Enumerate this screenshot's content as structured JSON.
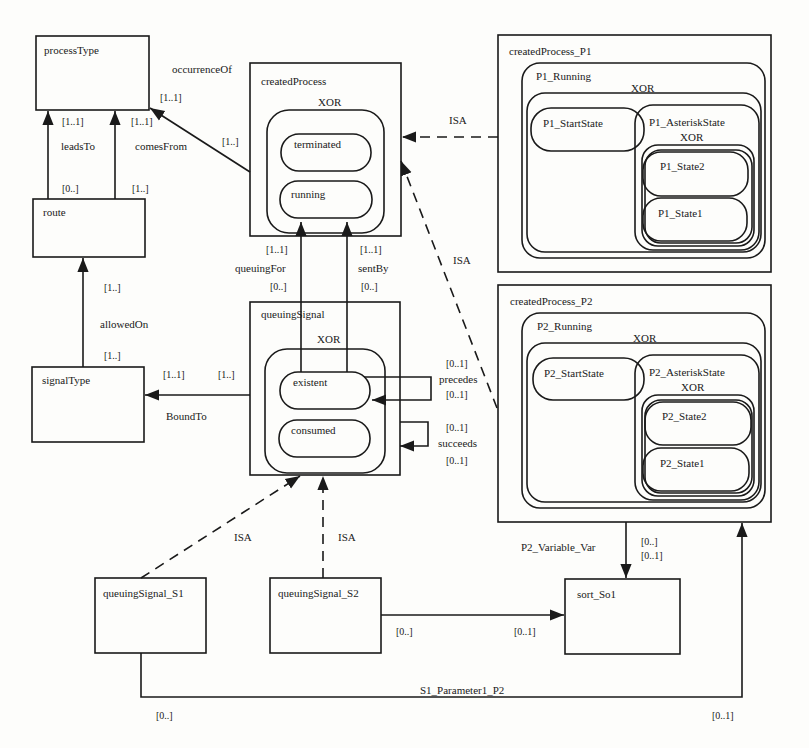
{
  "diagram": {
    "entities": {
      "processType": {
        "label": "processType"
      },
      "route": {
        "label": "route"
      },
      "signalType": {
        "label": "signalType"
      },
      "createdProcess": {
        "label": "createdProcess",
        "xor": "XOR",
        "states": [
          "terminated",
          "running"
        ]
      },
      "queuingSignal": {
        "label": "queuingSignal",
        "xor": "XOR",
        "states": [
          "existent",
          "consumed"
        ]
      },
      "createdProcess_P1": {
        "label": "createdProcess_P1",
        "running": "P1_Running",
        "xor": "XOR",
        "start": "P1_StartState",
        "asterisk": "P1_AsteriskState",
        "asterisk_xor": "XOR",
        "state2": "P1_State2",
        "state1": "P1_State1"
      },
      "createdProcess_P2": {
        "label": "createdProcess_P2",
        "running": "P2_Running",
        "xor": "XOR",
        "start": "P2_StartState",
        "asterisk": "P2_AsteriskState",
        "asterisk_xor": "XOR",
        "state2": "P2_State2",
        "state1": "P2_State1"
      },
      "queuingSignal_S1": {
        "label": "queuingSignal_S1"
      },
      "queuingSignal_S2": {
        "label": "queuingSignal_S2"
      },
      "sort_So1": {
        "label": "sort_So1"
      }
    },
    "relations": {
      "occurrenceOf": {
        "label": "occurrenceOf",
        "card_target": "[1..1]",
        "card_source": "[1..]"
      },
      "leadsTo": {
        "label": "leadsTo",
        "card_target": "[1..1]",
        "card_source": "[0..]"
      },
      "comesFrom": {
        "label": "comesFrom",
        "card_target": "[1..1]",
        "card_source": "[1..]"
      },
      "allowedOn": {
        "label": "allowedOn",
        "card_target": "[1..]",
        "card_source": "[1..]"
      },
      "boundTo": {
        "label": "BoundTo",
        "card_target": "[1..1]",
        "card_source": "[1..]"
      },
      "queuingFor": {
        "label": "queuingFor",
        "card_target": "[1..1]",
        "card_source": "[0..]"
      },
      "sentBy": {
        "label": "sentBy",
        "card_target": "[1..1]",
        "card_source": "[0..]"
      },
      "precedes": {
        "label": "precedes",
        "card_top": "[0..1]",
        "card_bottom": "[0..1]"
      },
      "succeeds": {
        "label": "succeeds",
        "card_top": "[0..1]",
        "card_bottom": "[0..1]"
      },
      "isa_p1": {
        "label": "ISA"
      },
      "isa_p2": {
        "label": "ISA"
      },
      "isa_s1": {
        "label": "ISA"
      },
      "isa_s2": {
        "label": "ISA"
      },
      "p2_variable_var": {
        "label": "P2_Variable_Var",
        "card_source": "[0..]",
        "card_target": "[0..1]"
      },
      "s2_to_sort": {
        "card_source": "[0..]",
        "card_target": "[0..1]"
      },
      "s1_parameter1_p2": {
        "label": "S1_Parameter1_P2",
        "card_source": "[0..]",
        "card_target": "[0..1]"
      }
    }
  }
}
